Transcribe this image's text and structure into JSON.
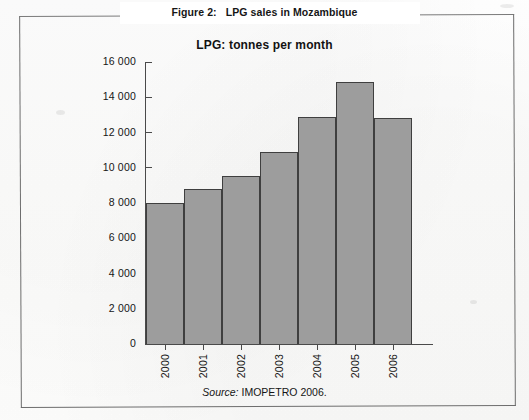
{
  "figure": {
    "caption_number": "Figure 2:",
    "caption_text": "LPG sales in Mozambique",
    "chart_title": "LPG: tonnes per month",
    "source_label": "Source:",
    "source_text": "IMOPETRO 2006."
  },
  "chart_data": {
    "type": "bar",
    "title": "LPG: tonnes per month",
    "xlabel": "",
    "ylabel": "",
    "categories": [
      "2000",
      "2001",
      "2002",
      "2003",
      "2004",
      "2005",
      "2006"
    ],
    "values": [
      8000,
      8800,
      9550,
      10900,
      12900,
      14850,
      12850
    ],
    "ylim": [
      0,
      16000
    ],
    "ytick_values": [
      0,
      2000,
      4000,
      6000,
      8000,
      10000,
      12000,
      14000,
      16000
    ],
    "ytick_labels": [
      "0",
      "2 000",
      "4 000",
      "6 000",
      "8 000",
      "10 000",
      "12 000",
      "14 000",
      "16 000"
    ],
    "grid": false,
    "legend": null,
    "bar_color": "#9d9d9d",
    "bar_edge_color": "#3f3f3f",
    "axis_color": "#4a4a4a",
    "bar_gap": 0,
    "xtick_rotation": -90
  }
}
